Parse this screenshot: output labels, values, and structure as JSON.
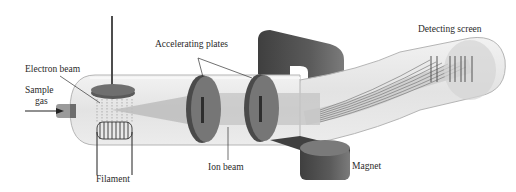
{
  "diagram": {
    "type": "mass-spectrometer",
    "labels": {
      "electron_beam": "Electron beam",
      "sample_gas_line1": "Sample",
      "sample_gas_line2": "gas",
      "filament": "Filament",
      "accelerating_plates": "Accelerating plates",
      "ion_beam": "Ion beam",
      "magnet": "Magnet",
      "detecting_screen": "Detecting screen"
    },
    "colors": {
      "tube": "#e6e6e6",
      "tube_outline": "#b5b5b5",
      "plate": "#6f6f6f",
      "plate_edge": "#4a4a4a",
      "magnet": "#4d4d4d",
      "magnet_top": "#7a7a7a",
      "beam": "#bdbdbd",
      "text": "#2a2a2a"
    }
  }
}
